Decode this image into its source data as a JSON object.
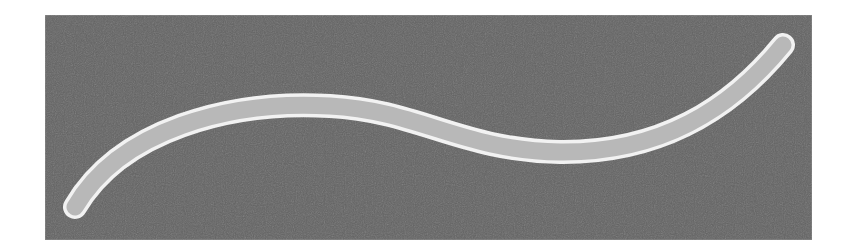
{
  "figure": {
    "panel": {
      "x": 45,
      "y": 15,
      "width": 767,
      "height": 225,
      "fill": "#636363",
      "border": "#8a8a8a"
    },
    "curve": {
      "path": "M 75 207 C 120 130, 230 100, 330 106 C 420 111, 460 150, 560 152 C 660 153, 730 110, 783 45",
      "outline_color": "#f2f2f2",
      "outline_width": 24,
      "fill_color": "#b8b8b8",
      "fill_width": 17,
      "linecap": "round"
    }
  }
}
